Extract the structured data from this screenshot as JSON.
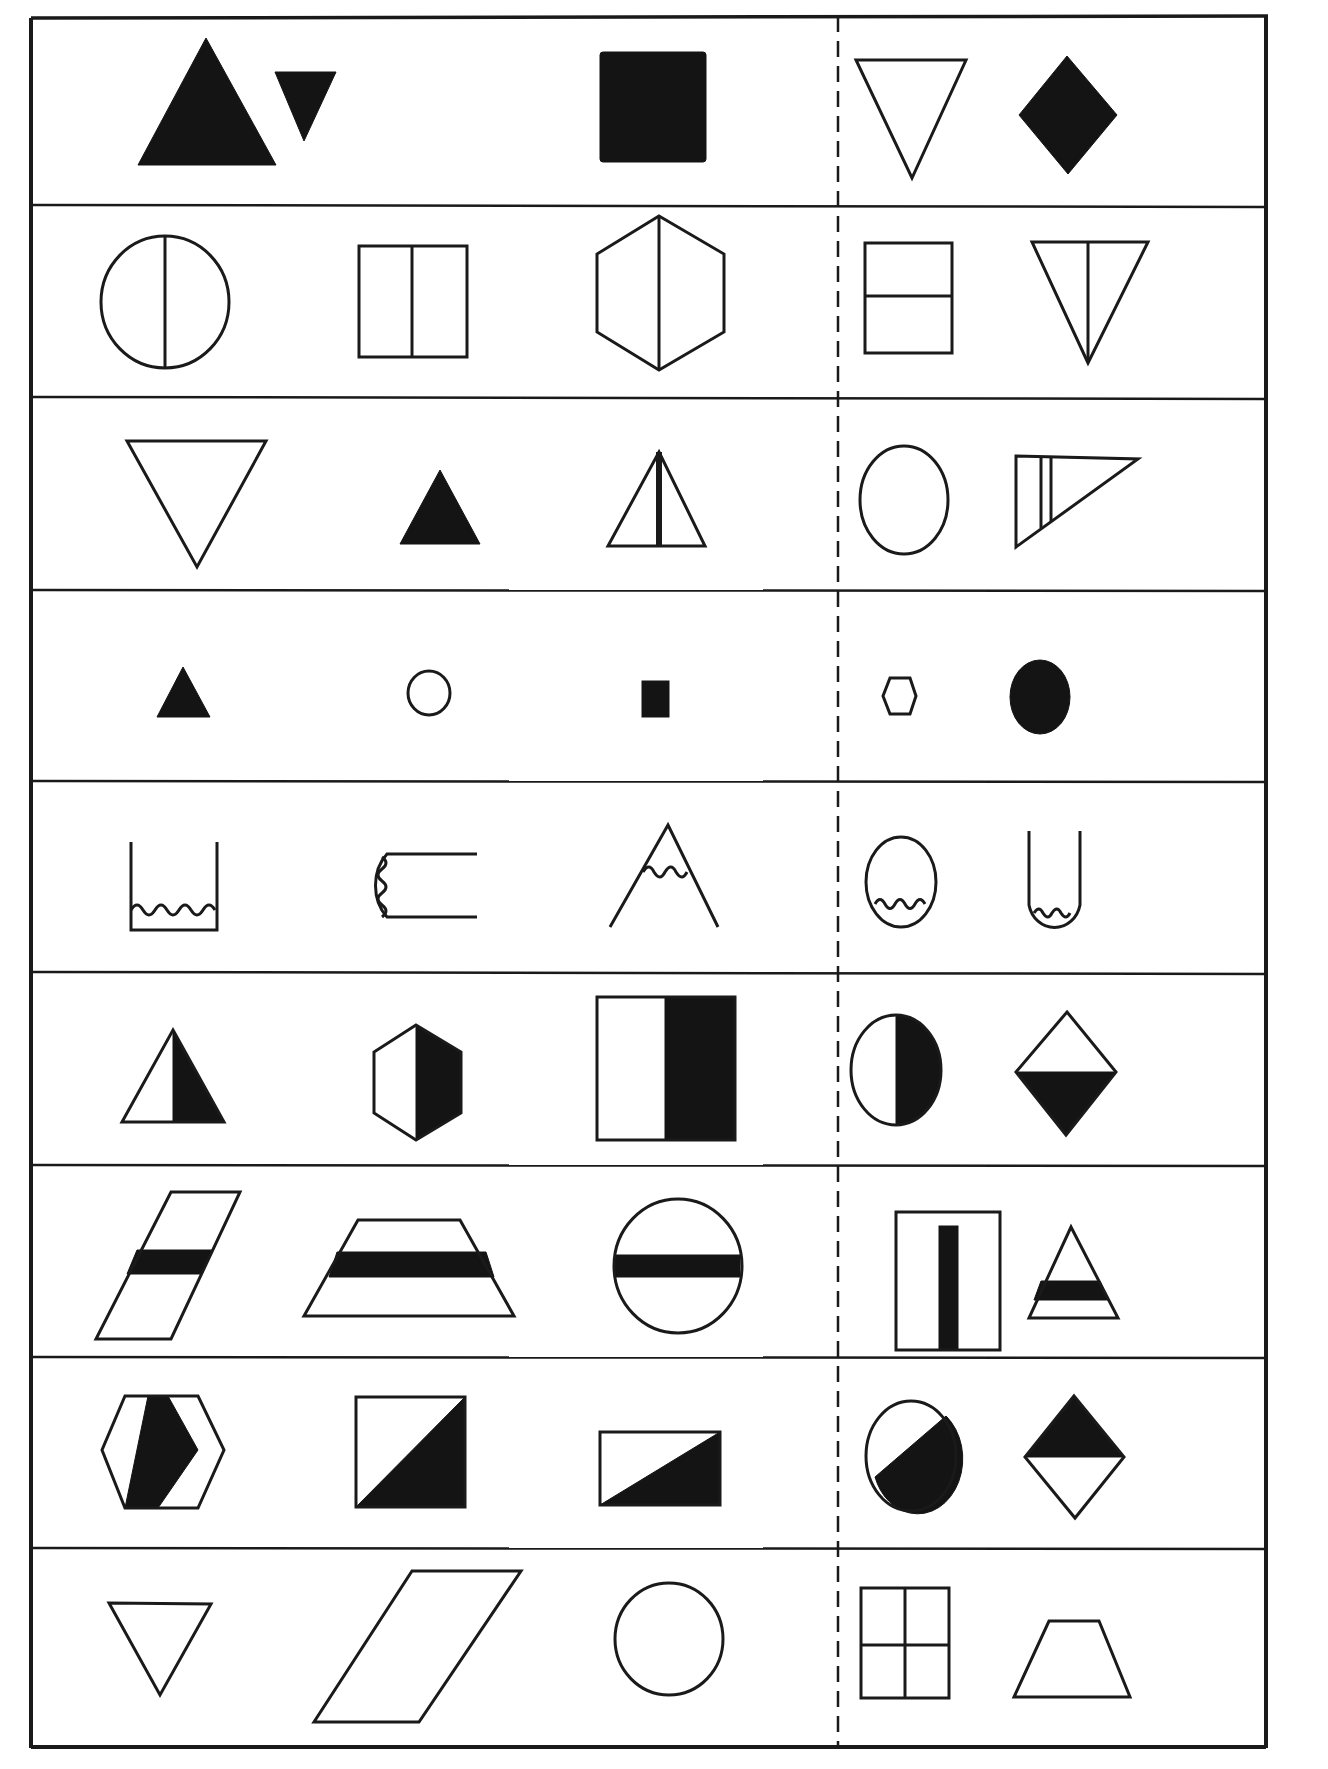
{
  "worksheet": {
    "type": "shape-matching worksheet",
    "layout": {
      "rows": 9,
      "left_group_count": 3,
      "right_group_count": 2,
      "divider": "dashed vertical line"
    },
    "colors": {
      "ink": "#141414",
      "paper": "#ffffff"
    },
    "rows": [
      {
        "index": 1,
        "left": [
          "large-solid-triangle-up",
          "small-solid-triangle-down",
          "solid-square"
        ],
        "right": [
          "outline-triangle-down",
          "solid-diamond"
        ]
      },
      {
        "index": 2,
        "left": [
          "circle-vertical-split",
          "rectangle-vertical-split",
          "hexagon-vertical-split"
        ],
        "right": [
          "rectangle-horizontal-split",
          "triangle-down-vertical-split"
        ]
      },
      {
        "index": 3,
        "left": [
          "outline-triangle-down",
          "small-solid-triangle-up",
          "triangle-up-thick-center-line"
        ],
        "right": [
          "outline-circle",
          "right-triangle-double-lines"
        ]
      },
      {
        "index": 4,
        "left": [
          "tiny-solid-triangle",
          "tiny-outline-circle",
          "tiny-solid-square"
        ],
        "right": [
          "tiny-outline-hexagon",
          "small-solid-circle"
        ]
      },
      {
        "index": 5,
        "left": [
          "cup-with-wavy-liquid",
          "sideways-u-with-wavy-line",
          "open-peak-with-wavy-line"
        ],
        "right": [
          "circle-with-wavy-bottom",
          "u-tube-with-wavy-bottom"
        ]
      },
      {
        "index": 6,
        "left": [
          "triangle-right-half-solid",
          "hexagon-right-half-solid",
          "rectangle-right-half-solid"
        ],
        "right": [
          "circle-right-half-solid",
          "diamond-bottom-half-solid"
        ]
      },
      {
        "index": 7,
        "left": [
          "parallelogram-solid-band",
          "trapezoid-solid-band",
          "circle-solid-band"
        ],
        "right": [
          "rectangle-vertical-solid-band",
          "triangle-solid-band"
        ]
      },
      {
        "index": 8,
        "left": [
          "hexagon-diagonal-half-solid",
          "square-diagonal-half-solid",
          "rectangle-diagonal-half-solid"
        ],
        "right": [
          "circle-diagonal-half-solid",
          "diamond-top-half-solid"
        ]
      },
      {
        "index": 9,
        "left": [
          "outline-triangle-down",
          "outline-parallelogram",
          "outline-circle"
        ],
        "right": [
          "rectangle-four-quadrants",
          "outline-trapezoid"
        ]
      }
    ]
  }
}
